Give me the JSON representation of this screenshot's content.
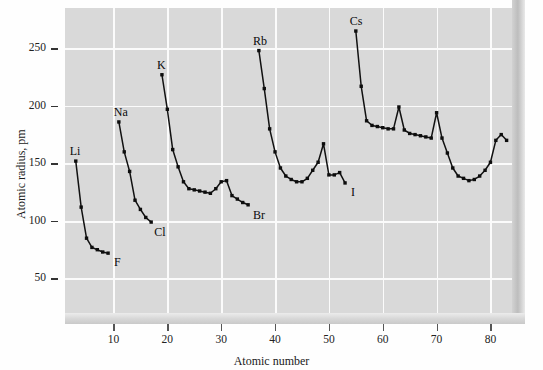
{
  "chart_data": {
    "type": "line",
    "title": "",
    "xlabel": "Atomic number",
    "ylabel": "Atomic radius, pm",
    "xlim": [
      1,
      84
    ],
    "ylim": [
      20,
      285
    ],
    "grid": true,
    "legend": "none",
    "xticks": [
      10,
      20,
      30,
      40,
      50,
      60,
      70,
      80
    ],
    "yticks": [
      50,
      100,
      150,
      200,
      250
    ],
    "marker": "square",
    "line_color": "#111111",
    "plot_background": "#d9d9d9",
    "gridline_color": "#fbfbfb",
    "series": [
      {
        "name": "Period 2",
        "x": [
          3,
          4,
          5,
          6,
          7,
          8,
          9
        ],
        "values": [
          152,
          112,
          85,
          77,
          75,
          73,
          72
        ]
      },
      {
        "name": "Period 3",
        "x": [
          11,
          12,
          13,
          14,
          15,
          16,
          17
        ],
        "values": [
          186,
          160,
          143,
          118,
          110,
          103,
          99
        ]
      },
      {
        "name": "Period 4",
        "x": [
          19,
          20,
          21,
          22,
          23,
          24,
          25,
          26,
          27,
          28,
          29,
          30,
          31,
          32,
          33,
          34,
          35
        ],
        "values": [
          227,
          197,
          162,
          147,
          134,
          128,
          127,
          126,
          125,
          124,
          128,
          134,
          135,
          122,
          119,
          116,
          114
        ]
      },
      {
        "name": "Period 5",
        "x": [
          37,
          38,
          39,
          40,
          41,
          42,
          43,
          44,
          45,
          46,
          47,
          48,
          49,
          50,
          51,
          52,
          53
        ],
        "values": [
          248,
          215,
          180,
          160,
          146,
          139,
          136,
          134,
          134,
          137,
          144,
          151,
          167,
          140,
          140,
          142,
          133
        ]
      },
      {
        "name": "Period 6",
        "x": [
          55,
          56,
          57,
          58,
          59,
          60,
          61,
          62,
          63,
          64,
          65,
          66,
          67,
          68,
          69,
          70,
          71,
          72,
          73,
          74,
          75,
          76,
          77,
          78,
          79,
          80,
          81,
          82,
          83
        ],
        "values": [
          265,
          217,
          187,
          183,
          182,
          181,
          180,
          180,
          199,
          179,
          176,
          175,
          174,
          173,
          172,
          194,
          172,
          159,
          146,
          139,
          137,
          135,
          136,
          139,
          144,
          151,
          170,
          175,
          170
        ]
      }
    ],
    "annotations": [
      {
        "text": "Li",
        "x": 3,
        "y": 152,
        "dx": -6,
        "dy": -16
      },
      {
        "text": "F",
        "x": 9,
        "y": 72,
        "dx": 6,
        "dy": 3
      },
      {
        "text": "Na",
        "x": 11,
        "y": 186,
        "dx": -5,
        "dy": -16
      },
      {
        "text": "Cl",
        "x": 17,
        "y": 99,
        "dx": 3,
        "dy": 4
      },
      {
        "text": "K",
        "x": 19,
        "y": 227,
        "dx": -5,
        "dy": -16
      },
      {
        "text": "Br",
        "x": 35,
        "y": 114,
        "dx": 5,
        "dy": 4
      },
      {
        "text": "Rb",
        "x": 37,
        "y": 248,
        "dx": -6,
        "dy": -16
      },
      {
        "text": "I",
        "x": 53,
        "y": 133,
        "dx": 6,
        "dy": 3
      },
      {
        "text": "Cs",
        "x": 55,
        "y": 265,
        "dx": -6,
        "dy": -16
      }
    ]
  }
}
